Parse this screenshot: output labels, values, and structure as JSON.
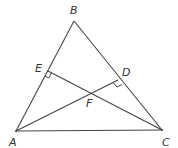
{
  "diagram": {
    "type": "triangle-with-altitudes",
    "points": {
      "A": {
        "label": "A",
        "x": 16,
        "y": 131,
        "lx": 9,
        "ly": 146
      },
      "B": {
        "label": "B",
        "x": 74,
        "y": 21,
        "lx": 70,
        "ly": 14
      },
      "C": {
        "label": "C",
        "x": 162,
        "y": 130,
        "lx": 162,
        "ly": 146
      },
      "D": {
        "label": "D",
        "x": 118,
        "y": 80,
        "lx": 122,
        "ly": 76
      },
      "E": {
        "label": "E",
        "x": 48,
        "y": 71,
        "lx": 35,
        "ly": 72
      },
      "F": {
        "label": "F",
        "x": 90,
        "y": 93,
        "lx": 86,
        "ly": 107
      }
    },
    "segments": [
      "AB",
      "BC",
      "CA",
      "AD",
      "CE"
    ],
    "right_angles": [
      "E",
      "D"
    ],
    "colors": {
      "stroke": "#444444",
      "label": "#333333",
      "background": "#ffffff"
    }
  }
}
